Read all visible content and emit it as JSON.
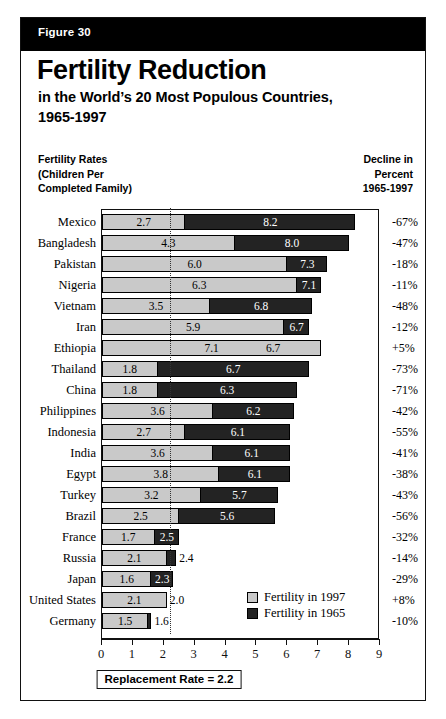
{
  "figure": {
    "banner_label": "Figure 30",
    "title_main": "Fertility Reduction",
    "title_sub1": "in the World’s 20 Most Populous Countries,",
    "title_sub2": "1965-1997",
    "left_caption_line1": "Fertility Rates",
    "left_caption_line2": "(Children Per",
    "left_caption_line3": "Completed Family)",
    "right_caption_line1": "Decline in",
    "right_caption_line2": "Percent",
    "right_caption_line3": "1965-1997"
  },
  "legend": {
    "item_light": "Fertility in 1997",
    "item_dark": "Fertility in 1965"
  },
  "annotation": {
    "replacement_rate_label": "Replacement Rate = 2.2",
    "replacement_rate_value": 2.2
  },
  "colors": {
    "bar_1997": "#c9c9c9",
    "bar_1965": "#232323",
    "banner_bg": "#000000",
    "frame": "#111111"
  },
  "chart_data": {
    "type": "bar",
    "orientation": "horizontal",
    "title": "Fertility Reduction in the World’s 20 Most Populous Countries, 1965-1997",
    "xlabel": "",
    "ylabel": "",
    "xlim": [
      0,
      9
    ],
    "xticks": [
      0,
      1,
      2,
      3,
      4,
      5,
      6,
      7,
      8,
      9
    ],
    "xtick_labels": [
      "0",
      "1",
      "2",
      "3",
      "4",
      "5",
      "6",
      "7",
      "8",
      "9"
    ],
    "grid": false,
    "legend_position": "inside-lower-right",
    "reference_line": {
      "value": 2.2,
      "label": "Replacement Rate = 2.2",
      "style": "dotted"
    },
    "categories": [
      "Mexico",
      "Bangladesh",
      "Pakistan",
      "Nigeria",
      "Vietnam",
      "Iran",
      "Ethiopia",
      "Thailand",
      "China",
      "Philippines",
      "Indonesia",
      "India",
      "Egypt",
      "Turkey",
      "Brazil",
      "France",
      "Russia",
      "Japan",
      "United States",
      "Germany"
    ],
    "series": [
      {
        "name": "Fertility in 1965",
        "values": [
          8.2,
          8.0,
          7.3,
          7.1,
          6.8,
          6.7,
          6.7,
          6.7,
          6.3,
          6.2,
          6.1,
          6.1,
          6.1,
          5.7,
          5.6,
          2.5,
          2.4,
          2.3,
          2.0,
          1.6
        ]
      },
      {
        "name": "Fertility in 1997",
        "values": [
          2.7,
          4.3,
          6.0,
          6.3,
          3.5,
          5.9,
          7.1,
          1.8,
          1.8,
          3.6,
          2.7,
          3.6,
          3.8,
          3.2,
          2.5,
          1.7,
          2.1,
          1.6,
          2.1,
          1.5
        ]
      }
    ],
    "decline_percent": [
      "-67%",
      "-47%",
      "-18%",
      "-11%",
      "-48%",
      "-12%",
      "+5%",
      "-73%",
      "-71%",
      "-42%",
      "-55%",
      "-41%",
      "-38%",
      "-43%",
      "-56%",
      "-32%",
      "-14%",
      "-29%",
      "+8%",
      "-10%"
    ],
    "rows": [
      {
        "country": "Mexico",
        "v1997": 2.7,
        "v1965": 8.2,
        "label_1997": "2.7",
        "label_1965": "8.2",
        "decline": "-67%"
      },
      {
        "country": "Bangladesh",
        "v1997": 4.3,
        "v1965": 8.0,
        "label_1997": "4.3",
        "label_1965": "8.0",
        "decline": "-47%"
      },
      {
        "country": "Pakistan",
        "v1997": 6.0,
        "v1965": 7.3,
        "label_1997": "6.0",
        "label_1965": "7.3",
        "decline": "-18%"
      },
      {
        "country": "Nigeria",
        "v1997": 6.3,
        "v1965": 7.1,
        "label_1997": "6.3",
        "label_1965": "7.1",
        "decline": "-11%"
      },
      {
        "country": "Vietnam",
        "v1997": 3.5,
        "v1965": 6.8,
        "label_1997": "3.5",
        "label_1965": "6.8",
        "decline": "-48%"
      },
      {
        "country": "Iran",
        "v1997": 5.9,
        "v1965": 6.7,
        "label_1997": "5.9",
        "label_1965": "6.7",
        "decline": "-12%"
      },
      {
        "country": "Ethiopia",
        "v1997": 7.1,
        "v1965": 6.7,
        "label_1997": "7.1",
        "label_1965": "6.7",
        "decline": "+5%"
      },
      {
        "country": "Thailand",
        "v1997": 1.8,
        "v1965": 6.7,
        "label_1997": "1.8",
        "label_1965": "6.7",
        "decline": "-73%"
      },
      {
        "country": "China",
        "v1997": 1.8,
        "v1965": 6.3,
        "label_1997": "1.8",
        "label_1965": "6.3",
        "decline": "-71%"
      },
      {
        "country": "Philippines",
        "v1997": 3.6,
        "v1965": 6.2,
        "label_1997": "3.6",
        "label_1965": "6.2",
        "decline": "-42%"
      },
      {
        "country": "Indonesia",
        "v1997": 2.7,
        "v1965": 6.1,
        "label_1997": "2.7",
        "label_1965": "6.1",
        "decline": "-55%"
      },
      {
        "country": "India",
        "v1997": 3.6,
        "v1965": 6.1,
        "label_1997": "3.6",
        "label_1965": "6.1",
        "decline": "-41%"
      },
      {
        "country": "Egypt",
        "v1997": 3.8,
        "v1965": 6.1,
        "label_1997": "3.8",
        "label_1965": "6.1",
        "decline": "-38%"
      },
      {
        "country": "Turkey",
        "v1997": 3.2,
        "v1965": 5.7,
        "label_1997": "3.2",
        "label_1965": "5.7",
        "decline": "-43%"
      },
      {
        "country": "Brazil",
        "v1997": 2.5,
        "v1965": 5.6,
        "label_1997": "2.5",
        "label_1965": "5.6",
        "decline": "-56%"
      },
      {
        "country": "France",
        "v1997": 1.7,
        "v1965": 2.5,
        "label_1997": "1.7",
        "label_1965": "2.5",
        "decline": "-32%"
      },
      {
        "country": "Russia",
        "v1997": 2.1,
        "v1965": 2.4,
        "label_1997": "2.1",
        "label_1965": "2.4",
        "decline": "-14%"
      },
      {
        "country": "Japan",
        "v1997": 1.6,
        "v1965": 2.3,
        "label_1997": "1.6",
        "label_1965": "2.3",
        "decline": "-29%"
      },
      {
        "country": "United States",
        "v1997": 2.1,
        "v1965": 2.0,
        "label_1997": "2.1",
        "label_1965": "2.0",
        "decline": "+8%"
      },
      {
        "country": "Germany",
        "v1997": 1.5,
        "v1965": 1.6,
        "label_1997": "1.5",
        "label_1965": "1.6",
        "decline": "-10%"
      }
    ]
  }
}
